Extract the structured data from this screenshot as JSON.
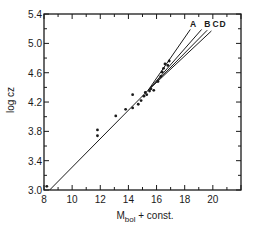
{
  "chart_data": {
    "type": "scatter",
    "title": "",
    "xlabel": "M_bol + const.",
    "xlabel_main": "M",
    "xlabel_sub": "bol",
    "xlabel_rest": " + const.",
    "ylabel": "log cz",
    "xlim": [
      8,
      22
    ],
    "ylim": [
      3.0,
      5.4
    ],
    "x_ticks": [
      8,
      10,
      12,
      14,
      16,
      18,
      20
    ],
    "x_tick_labels": [
      "8",
      "10",
      "12",
      "14",
      "16",
      "18",
      "20"
    ],
    "y_ticks": [
      3.0,
      3.4,
      3.8,
      4.2,
      4.6,
      5.0,
      5.4
    ],
    "y_tick_labels": [
      "3.0",
      "3.4",
      "3.8",
      "4.2",
      "4.6",
      "5.0",
      "5.4"
    ],
    "grid": false,
    "legend": "none",
    "points": [
      {
        "x": 8.2,
        "y": 3.05
      },
      {
        "x": 11.8,
        "y": 3.82
      },
      {
        "x": 11.8,
        "y": 3.74
      },
      {
        "x": 13.1,
        "y": 4.01
      },
      {
        "x": 13.8,
        "y": 4.1
      },
      {
        "x": 14.3,
        "y": 4.3
      },
      {
        "x": 14.3,
        "y": 4.12
      },
      {
        "x": 14.7,
        "y": 4.17
      },
      {
        "x": 14.9,
        "y": 4.22
      },
      {
        "x": 15.1,
        "y": 4.28
      },
      {
        "x": 15.2,
        "y": 4.33
      },
      {
        "x": 15.3,
        "y": 4.3
      },
      {
        "x": 15.5,
        "y": 4.35
      },
      {
        "x": 15.6,
        "y": 4.38
      },
      {
        "x": 15.8,
        "y": 4.36
      },
      {
        "x": 16.1,
        "y": 4.48
      },
      {
        "x": 16.3,
        "y": 4.55
      },
      {
        "x": 16.4,
        "y": 4.61
      },
      {
        "x": 16.5,
        "y": 4.66
      },
      {
        "x": 16.6,
        "y": 4.72
      },
      {
        "x": 16.8,
        "y": 4.7
      },
      {
        "x": 16.9,
        "y": 4.76
      }
    ],
    "series": [
      {
        "name": "baseline",
        "x": [
          8.4,
          15.4
        ],
        "y": [
          3.0,
          4.36
        ]
      },
      {
        "name": "A",
        "x": [
          15.4,
          18.4
        ],
        "y": [
          4.36,
          5.19
        ]
      },
      {
        "name": "B",
        "x": [
          15.4,
          19.2
        ],
        "y": [
          4.36,
          5.19
        ]
      },
      {
        "name": "C",
        "x": [
          15.4,
          19.6
        ],
        "y": [
          4.36,
          5.18
        ]
      },
      {
        "name": "D",
        "x": [
          15.4,
          19.9
        ],
        "y": [
          4.36,
          5.17
        ]
      }
    ],
    "annotations": [
      {
        "text": "A",
        "x": 18.6,
        "y": 5.26
      },
      {
        "text": "B",
        "x": 19.6,
        "y": 5.26
      },
      {
        "text": "C",
        "x": 20.2,
        "y": 5.26
      },
      {
        "text": "D",
        "x": 20.7,
        "y": 5.26
      }
    ]
  }
}
